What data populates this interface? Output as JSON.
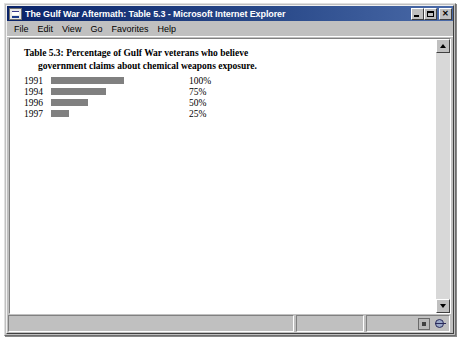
{
  "window": {
    "title": "The Gulf War Aftermath: Table 5.3 - Microsoft Internet Explorer",
    "icon": "document-icon",
    "buttons": {
      "minimize": "_",
      "maximize": "□",
      "close": "✕"
    }
  },
  "menu": {
    "items": [
      {
        "label": "File",
        "mnemonic": "F"
      },
      {
        "label": "Edit",
        "mnemonic": "E"
      },
      {
        "label": "View",
        "mnemonic": "V"
      },
      {
        "label": "Go",
        "mnemonic": "G"
      },
      {
        "label": "Favorites",
        "mnemonic": "a"
      },
      {
        "label": "Help",
        "mnemonic": "H"
      }
    ]
  },
  "document": {
    "caption_line1": "Table 5.3: Percentage of Gulf War veterans who believe",
    "caption_line2": "government claims about chemical weapons exposure."
  },
  "chart_data": {
    "type": "bar",
    "title": "Table 5.3: Percentage of Gulf War veterans who believe government claims about chemical weapons exposure.",
    "orientation": "horizontal",
    "categories": [
      "1991",
      "1994",
      "1996",
      "1997"
    ],
    "values": [
      100,
      75,
      50,
      25
    ],
    "value_labels": [
      "100%",
      "75%",
      "50%",
      "25%"
    ],
    "xlabel": "",
    "ylabel": "",
    "xlim": [
      0,
      100
    ],
    "grid": false,
    "legend": "none",
    "bar_color": "#808080",
    "rows": [
      {
        "year": "1991",
        "value": 100,
        "label": "100%"
      },
      {
        "year": "1994",
        "value": 75,
        "label": "75%"
      },
      {
        "year": "1996",
        "value": 50,
        "label": "50%"
      },
      {
        "year": "1997",
        "value": 25,
        "label": "25%"
      }
    ]
  },
  "scrollbar": {
    "up_arrow": "scroll-up",
    "down_arrow": "scroll-down"
  },
  "status": {
    "main": "",
    "progress": "",
    "zone": "",
    "icons": [
      "security-zone-icon",
      "globe-icon"
    ]
  }
}
